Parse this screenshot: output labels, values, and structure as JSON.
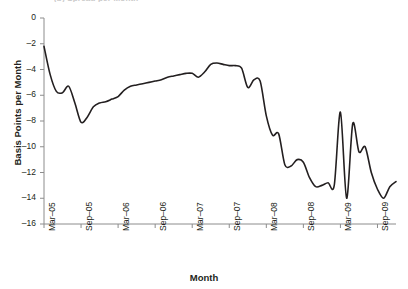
{
  "figure": {
    "clipped_title": "(b) Spread per Month",
    "x_axis_title": "Month",
    "y_axis_title": "Basis Points per Month",
    "line_color": "#231f20",
    "axis_color": "#8c8c8c"
  },
  "chart_data": {
    "type": "line",
    "title": "",
    "xlabel": "Month",
    "ylabel": "Basis Points per Month",
    "xlim": [
      "Mar-05",
      "Dec-09"
    ],
    "ylim": [
      -16,
      0
    ],
    "ytick_labels": [
      "0",
      "-2",
      "-4",
      "-6",
      "-8",
      "-10",
      "-12",
      "-14",
      "-16"
    ],
    "ytick_values": [
      0,
      -2,
      -4,
      -6,
      -8,
      -10,
      -12,
      -14,
      -16
    ],
    "xtick_labels": [
      "Mar-05",
      "Sep-05",
      "Mar-06",
      "Sep-06",
      "Mar-07",
      "Sep-07",
      "Mar-08",
      "Sep-08",
      "Mar-09",
      "Sep-09"
    ],
    "grid": false,
    "legend": "none",
    "series": [
      {
        "name": "Basis Points per Month",
        "x": [
          "Mar-05",
          "Apr-05",
          "May-05",
          "Jun-05",
          "Jul-05",
          "Aug-05",
          "Sep-05",
          "Oct-05",
          "Nov-05",
          "Dec-05",
          "Jan-06",
          "Feb-06",
          "Mar-06",
          "Apr-06",
          "May-06",
          "Jun-06",
          "Jul-06",
          "Aug-06",
          "Sep-06",
          "Oct-06",
          "Nov-06",
          "Dec-06",
          "Jan-07",
          "Feb-07",
          "Mar-07",
          "Apr-07",
          "May-07",
          "Jun-07",
          "Jul-07",
          "Aug-07",
          "Sep-07",
          "Oct-07",
          "Nov-07",
          "Dec-07",
          "Jan-08",
          "Feb-08",
          "Mar-08",
          "Apr-08",
          "May-08",
          "Jun-08",
          "Jul-08",
          "Aug-08",
          "Sep-08",
          "Oct-08",
          "Nov-08",
          "Dec-08",
          "Jan-09",
          "Feb-09",
          "Mar-09",
          "Apr-09",
          "May-09",
          "Jun-09",
          "Jul-09",
          "Aug-09",
          "Sep-09",
          "Oct-09",
          "Nov-09",
          "Dec-09"
        ],
        "values": [
          -2.2,
          -4.4,
          -5.7,
          -5.8,
          -5.3,
          -6.6,
          -8.1,
          -7.7,
          -6.9,
          -6.6,
          -6.5,
          -6.3,
          -6.1,
          -5.6,
          -5.3,
          -5.2,
          -5.1,
          -5.0,
          -4.9,
          -4.8,
          -4.6,
          -4.5,
          -4.4,
          -4.3,
          -4.3,
          -4.6,
          -4.2,
          -3.6,
          -3.5,
          -3.6,
          -3.7,
          -3.7,
          -3.9,
          -5.4,
          -4.8,
          -4.9,
          -7.6,
          -9.1,
          -9.0,
          -11.4,
          -11.5,
          -11.0,
          -11.2,
          -12.4,
          -13.1,
          -13.0,
          -12.8,
          -13.0,
          -7.3,
          -14.0,
          -8.2,
          -10.4,
          -10.0,
          -12.0,
          -13.3,
          -14.0,
          -13.1,
          -12.7
        ]
      }
    ]
  },
  "axis": {
    "y_ticks": [
      {
        "label": "0",
        "value": 0
      },
      {
        "label": "-2",
        "value": -2
      },
      {
        "label": "-4",
        "value": -4
      },
      {
        "label": "-6",
        "value": -6
      },
      {
        "label": "-8",
        "value": -8
      },
      {
        "label": "-10",
        "value": -10
      },
      {
        "label": "-12",
        "value": -12
      },
      {
        "label": "-14",
        "value": -14
      },
      {
        "label": "-16",
        "value": -16
      }
    ],
    "x_ticks": [
      {
        "label": "Mar-05"
      },
      {
        "label": "Sep-05"
      },
      {
        "label": "Mar-06"
      },
      {
        "label": "Sep-06"
      },
      {
        "label": "Mar-07"
      },
      {
        "label": "Sep-07"
      },
      {
        "label": "Mar-08"
      },
      {
        "label": "Sep-08"
      },
      {
        "label": "Mar-09"
      },
      {
        "label": "Sep-09"
      }
    ]
  }
}
